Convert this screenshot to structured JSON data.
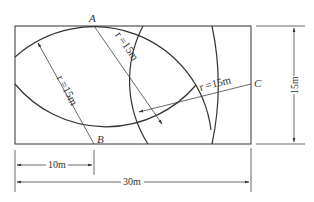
{
  "points": {
    "A": "A",
    "B": "B",
    "C": "C"
  },
  "radius_labels": {
    "from_B": "r =15m",
    "from_A": "r =15m",
    "from_C": "r =15m"
  },
  "dimensions": {
    "height": "15m",
    "width": "30m",
    "offset": "10m"
  },
  "colors": {
    "stroke": "#333333",
    "background": "#ffffff"
  }
}
